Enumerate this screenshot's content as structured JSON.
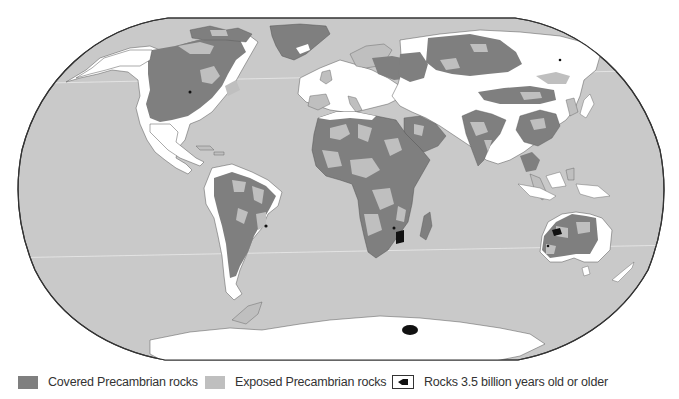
{
  "map": {
    "projection": "Robinson world map",
    "colors": {
      "ocean": "#c9c9c9",
      "land_non_precambrian": "#ffffff",
      "covered_precambrian": "#7f7f7f",
      "exposed_precambrian": "#bfbfbf",
      "oldest_rocks": "#111111",
      "frame": "#333333"
    },
    "oldest_rock_sites": [
      "Western Greenland / North America interior",
      "Brazil (São Francisco craton)",
      "Southern Africa (Kaapvaal craton)",
      "Western Australia (Pilbara)",
      "Western Australia (Yilgarn)",
      "Antarctica (Enderby Land)"
    ]
  },
  "legend": {
    "items": [
      {
        "label": "Covered Precambrian rocks",
        "swatch": "covered",
        "color": "#7f7f7f"
      },
      {
        "label": "Exposed Precambrian rocks",
        "swatch": "exposed",
        "color": "#bfbfbf"
      },
      {
        "label": "Rocks 3.5 billion years old or older",
        "swatch": "old-rocks-symbol",
        "color": "#111111"
      }
    ]
  }
}
